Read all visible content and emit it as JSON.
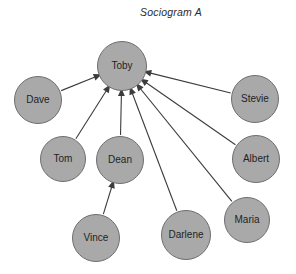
{
  "title": "Sociogram A",
  "style": {
    "node_fill": "#a9a9a9",
    "node_stroke": "#6e6e6e",
    "edge_color": "#3c3c3c",
    "label_color": "#1f1f1f",
    "background": "#ffffff"
  },
  "nodes": [
    {
      "id": "toby",
      "label": "Toby",
      "cx": 122,
      "cy": 66,
      "r": 25
    },
    {
      "id": "dave",
      "label": "Dave",
      "cx": 38,
      "cy": 100,
      "r": 24
    },
    {
      "id": "stevie",
      "label": "Stevie",
      "cx": 255,
      "cy": 99,
      "r": 24
    },
    {
      "id": "tom",
      "label": "Tom",
      "cx": 63,
      "cy": 159,
      "r": 23
    },
    {
      "id": "dean",
      "label": "Dean",
      "cx": 120,
      "cy": 160,
      "r": 24
    },
    {
      "id": "albert",
      "label": "Albert",
      "cx": 256,
      "cy": 159,
      "r": 24
    },
    {
      "id": "vince",
      "label": "Vince",
      "cx": 96,
      "cy": 238,
      "r": 24
    },
    {
      "id": "darlene",
      "label": "Darlene",
      "cx": 186,
      "cy": 235,
      "r": 25
    },
    {
      "id": "maria",
      "label": "Maria",
      "cx": 247,
      "cy": 220,
      "r": 23
    }
  ],
  "edges": [
    {
      "from": "dave",
      "to": "toby",
      "directed": true
    },
    {
      "from": "tom",
      "to": "toby",
      "directed": true
    },
    {
      "from": "dean",
      "to": "toby",
      "directed": true
    },
    {
      "from": "stevie",
      "to": "toby",
      "directed": true
    },
    {
      "from": "albert",
      "to": "toby",
      "directed": true
    },
    {
      "from": "maria",
      "to": "toby",
      "directed": true
    },
    {
      "from": "darlene",
      "to": "toby",
      "directed": true
    },
    {
      "from": "vince",
      "to": "dean",
      "directed": true
    }
  ]
}
